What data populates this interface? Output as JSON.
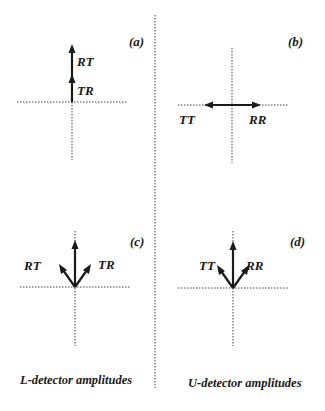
{
  "panels": {
    "a": {
      "tag": "(a)",
      "vectors": [
        {
          "label": "TR",
          "direction": "up",
          "stacked_order": 1
        },
        {
          "label": "RT",
          "direction": "up",
          "stacked_order": 2
        }
      ]
    },
    "b": {
      "tag": "(b)",
      "vectors": [
        {
          "label": "TT",
          "direction": "left"
        },
        {
          "label": "RR",
          "direction": "right"
        }
      ]
    },
    "c": {
      "tag": "(c)",
      "vectors": [
        {
          "label": "RT",
          "direction": "up-left"
        },
        {
          "label": "TR",
          "direction": "up-right"
        },
        {
          "label": "",
          "direction": "up"
        }
      ]
    },
    "d": {
      "tag": "(d)",
      "vectors": [
        {
          "label": "TT",
          "direction": "up-left"
        },
        {
          "label": "RR",
          "direction": "up-right"
        },
        {
          "label": "",
          "direction": "up"
        }
      ]
    }
  },
  "captions": {
    "left": "L-detector amplitudes",
    "right": "U-detector amplitudes"
  },
  "colors": {
    "ink": "#1a1a1a",
    "axis": "#444444",
    "background": "#ffffff"
  }
}
